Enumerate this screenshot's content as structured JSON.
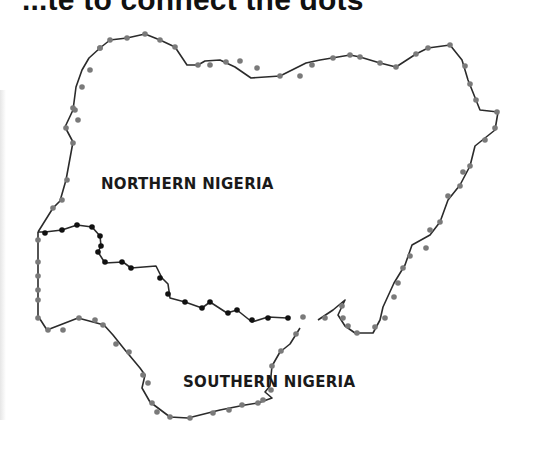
{
  "title": "...te to connect the dots",
  "labels": {
    "north": "NORTHERN NIGERIA",
    "south": "SOUTHERN NIGERIA"
  },
  "colors": {
    "line": "#2b2b2b",
    "border_dot": "#7a7a7a",
    "inner_dot": "#111111",
    "background": "#ffffff"
  },
  "outer_border": [
    [
      100,
      48
    ],
    [
      110,
      40
    ],
    [
      127,
      38
    ],
    [
      145,
      34
    ],
    [
      160,
      40
    ],
    [
      175,
      47
    ],
    [
      187,
      65
    ],
    [
      198,
      65
    ],
    [
      205,
      61
    ],
    [
      220,
      60
    ],
    [
      235,
      67
    ],
    [
      251,
      78
    ],
    [
      280,
      76
    ],
    [
      292,
      70
    ],
    [
      306,
      63
    ],
    [
      320,
      60
    ],
    [
      350,
      55
    ],
    [
      360,
      57
    ],
    [
      380,
      63
    ],
    [
      396,
      67
    ],
    [
      416,
      54
    ],
    [
      428,
      48
    ],
    [
      450,
      45
    ],
    [
      462,
      60
    ],
    [
      468,
      80
    ],
    [
      480,
      110
    ],
    [
      498,
      112
    ],
    [
      495,
      130
    ],
    [
      475,
      146
    ],
    [
      470,
      166
    ],
    [
      460,
      185
    ],
    [
      448,
      200
    ],
    [
      440,
      222
    ],
    [
      430,
      235
    ],
    [
      412,
      245
    ],
    [
      405,
      265
    ],
    [
      394,
      283
    ],
    [
      383,
      307
    ],
    [
      380,
      320
    ],
    [
      373,
      333
    ],
    [
      355,
      333
    ],
    [
      345,
      326
    ],
    [
      338,
      315
    ],
    [
      345,
      300
    ],
    [
      333,
      310
    ],
    [
      318,
      320
    ]
  ],
  "outer_border_south": [
    [
      300,
      328
    ],
    [
      290,
      344
    ],
    [
      280,
      352
    ],
    [
      272,
      366
    ],
    [
      270,
      386
    ],
    [
      265,
      392
    ],
    [
      272,
      398
    ],
    [
      258,
      403
    ],
    [
      245,
      405
    ],
    [
      220,
      410
    ],
    [
      188,
      418
    ],
    [
      170,
      417
    ],
    [
      150,
      402
    ],
    [
      142,
      388
    ],
    [
      145,
      375
    ],
    [
      140,
      368
    ],
    [
      125,
      350
    ],
    [
      113,
      335
    ],
    [
      104,
      325
    ],
    [
      93,
      322
    ],
    [
      78,
      318
    ],
    [
      47,
      330
    ],
    [
      38,
      316
    ],
    [
      38,
      285
    ],
    [
      38,
      255
    ],
    [
      38,
      232
    ]
  ],
  "outer_border_west": [
    [
      38,
      232
    ],
    [
      53,
      208
    ],
    [
      60,
      201
    ],
    [
      66,
      180
    ],
    [
      73,
      142
    ],
    [
      65,
      127
    ],
    [
      73,
      110
    ],
    [
      76,
      87
    ],
    [
      82,
      70
    ],
    [
      89,
      58
    ],
    [
      100,
      48
    ]
  ],
  "inner_boundary": [
    [
      38,
      232
    ],
    [
      45,
      232
    ],
    [
      62,
      230
    ],
    [
      77,
      225
    ],
    [
      92,
      227
    ],
    [
      100,
      236
    ],
    [
      101,
      246
    ],
    [
      98,
      252
    ],
    [
      105,
      263
    ],
    [
      123,
      262
    ],
    [
      131,
      268
    ],
    [
      156,
      266
    ],
    [
      162,
      278
    ],
    [
      168,
      284
    ],
    [
      170,
      298
    ],
    [
      185,
      302
    ],
    [
      202,
      308
    ],
    [
      210,
      302
    ],
    [
      227,
      313
    ],
    [
      237,
      310
    ],
    [
      252,
      322
    ],
    [
      268,
      317
    ],
    [
      287,
      318
    ]
  ],
  "outer_dots": [
    [
      100,
      48
    ],
    [
      110,
      40
    ],
    [
      127,
      38
    ],
    [
      145,
      34
    ],
    [
      160,
      40
    ],
    [
      175,
      47
    ],
    [
      198,
      65
    ],
    [
      210,
      65
    ],
    [
      226,
      62
    ],
    [
      240,
      61
    ],
    [
      257,
      68
    ],
    [
      280,
      76
    ],
    [
      300,
      76
    ],
    [
      312,
      65
    ],
    [
      333,
      58
    ],
    [
      350,
      55
    ],
    [
      360,
      57
    ],
    [
      380,
      63
    ],
    [
      396,
      67
    ],
    [
      416,
      54
    ],
    [
      428,
      48
    ],
    [
      450,
      45
    ],
    [
      465,
      66
    ],
    [
      470,
      84
    ],
    [
      476,
      100
    ],
    [
      497,
      112
    ],
    [
      495,
      128
    ],
    [
      485,
      140
    ],
    [
      470,
      166
    ],
    [
      463,
      172
    ],
    [
      460,
      186
    ],
    [
      448,
      196
    ],
    [
      440,
      222
    ],
    [
      430,
      230
    ],
    [
      426,
      248
    ],
    [
      410,
      256
    ],
    [
      403,
      268
    ],
    [
      398,
      283
    ],
    [
      394,
      297
    ],
    [
      385,
      318
    ],
    [
      375,
      327
    ],
    [
      357,
      333
    ],
    [
      348,
      326
    ],
    [
      343,
      318
    ],
    [
      342,
      306
    ],
    [
      325,
      318
    ],
    [
      303,
      317
    ],
    [
      296,
      334
    ],
    [
      281,
      351
    ],
    [
      272,
      366
    ],
    [
      263,
      400
    ],
    [
      271,
      390
    ],
    [
      258,
      403
    ],
    [
      242,
      405
    ],
    [
      229,
      410
    ],
    [
      213,
      413
    ],
    [
      190,
      418
    ],
    [
      170,
      417
    ],
    [
      157,
      412
    ],
    [
      152,
      403
    ],
    [
      148,
      383
    ],
    [
      143,
      375
    ],
    [
      129,
      352
    ],
    [
      116,
      344
    ],
    [
      103,
      325
    ],
    [
      95,
      320
    ],
    [
      79,
      318
    ],
    [
      63,
      330
    ],
    [
      48,
      330
    ],
    [
      38,
      318
    ],
    [
      38,
      300
    ],
    [
      38,
      290
    ],
    [
      38,
      276
    ],
    [
      38,
      262
    ],
    [
      38,
      240
    ],
    [
      53,
      208
    ],
    [
      62,
      200
    ],
    [
      67,
      180
    ],
    [
      73,
      143
    ],
    [
      78,
      120
    ],
    [
      66,
      128
    ],
    [
      75,
      110
    ],
    [
      73,
      108
    ],
    [
      82,
      87
    ],
    [
      90,
      70
    ],
    [
      100,
      48
    ]
  ],
  "inner_dots": [
    [
      45,
      233
    ],
    [
      62,
      230
    ],
    [
      77,
      225
    ],
    [
      92,
      227
    ],
    [
      100,
      236
    ],
    [
      101,
      246
    ],
    [
      98,
      252
    ],
    [
      105,
      262
    ],
    [
      122,
      262
    ],
    [
      131,
      268
    ],
    [
      160,
      278
    ],
    [
      168,
      294
    ],
    [
      185,
      302
    ],
    [
      202,
      308
    ],
    [
      210,
      302
    ],
    [
      228,
      313
    ],
    [
      237,
      310
    ],
    [
      252,
      320
    ],
    [
      268,
      318
    ],
    [
      288,
      318
    ]
  ]
}
